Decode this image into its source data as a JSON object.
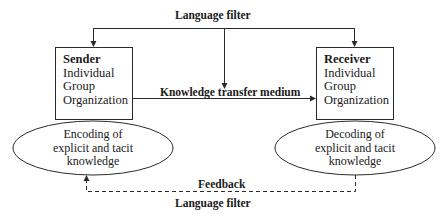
{
  "diagram": {
    "top_label": "Language filter",
    "medium_label": "Knowledge transfer medium",
    "feedback_label": "Feedback",
    "bottom_label": "Language filter",
    "sender": {
      "title": "Sender",
      "levels": [
        "Individual",
        "Group",
        "Organization"
      ],
      "process": [
        "Encoding of",
        "explicit and tacit",
        "knowledge"
      ]
    },
    "receiver": {
      "title": "Receiver",
      "levels": [
        "Individual",
        "Group",
        "Organization"
      ],
      "process": [
        "Decoding of",
        "explicit and tacit",
        "knowledge"
      ]
    },
    "colors": {
      "stroke": "#2a2a2a",
      "background": "#ffffff"
    }
  }
}
